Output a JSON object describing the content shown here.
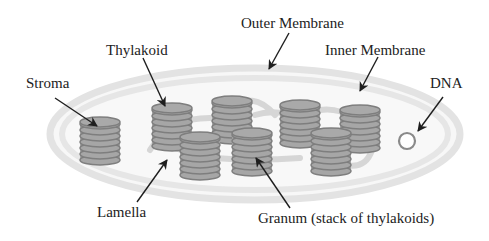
{
  "labels": {
    "outer_membrane": "Outer Membrane",
    "inner_membrane": "Inner Membrane",
    "thylakoid": "Thylakoid",
    "stroma": "Stroma",
    "dna": "DNA",
    "lamella": "Lamella",
    "granum": "Granum (stack of thylakoids)"
  },
  "colors": {
    "membrane": "#e3e3e3",
    "stroma_fill": "#f7f7f7",
    "disc_fill": "#a6a6a6",
    "disc_edge": "#7e7e7e",
    "lamella": "#d4d4d4",
    "dna_ring": "#8a8a8a",
    "arrow": "#1e1e1e",
    "text": "#222222"
  },
  "structure": {
    "granum_count": 8,
    "discs_per_granum": 7
  }
}
